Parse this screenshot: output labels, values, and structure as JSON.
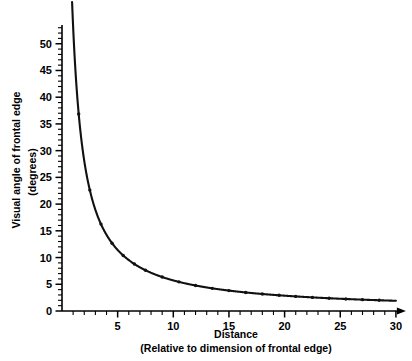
{
  "chart_data": {
    "type": "line",
    "title": "",
    "subtitle": "",
    "xlabel": "Distance",
    "xlabel_sub": "(Relative to dimension of frontal edge)",
    "ylabel": "Visual angle of frontal edge",
    "ylabel_sub": "(degrees)",
    "xlim": [
      0,
      30
    ],
    "ylim": [
      0,
      53.5
    ],
    "grid": false,
    "legend": null,
    "x_major_ticks": [
      5,
      10,
      15,
      20,
      25,
      30
    ],
    "x_major_tick_labels": [
      "5",
      "10",
      "15",
      "20",
      "25",
      "30"
    ],
    "x_minor_tick_step": 1,
    "y_major_ticks": [
      0,
      5,
      10,
      15,
      20,
      25,
      30,
      35,
      40,
      45,
      50
    ],
    "y_major_tick_labels": [
      "0",
      "5",
      "10",
      "15",
      "20",
      "25",
      "30",
      "35",
      "40",
      "45",
      "50"
    ],
    "y_minor_tick_step": 1,
    "series": [
      {
        "name": "Visual angle vs distance",
        "x": [
          1,
          1.2,
          1.5,
          2,
          2.5,
          3,
          3.5,
          4,
          5,
          6,
          7,
          8,
          9,
          10,
          11,
          12,
          13,
          14,
          15,
          16,
          17,
          18,
          19,
          20,
          21,
          22,
          23,
          24,
          25,
          26,
          27,
          28,
          29,
          30
        ],
        "y": [
          53.1,
          45.2,
          36.9,
          28.1,
          22.6,
          18.9,
          16.3,
          14.3,
          11.4,
          9.5,
          8.2,
          7.2,
          6.4,
          5.7,
          5.2,
          4.8,
          4.4,
          4.1,
          3.8,
          3.6,
          3.4,
          3.2,
          3.0,
          2.9,
          2.7,
          2.6,
          2.5,
          2.4,
          2.3,
          2.2,
          2.1,
          2.0,
          2.0,
          1.9
        ],
        "marker_x": [
          1.5,
          2.5,
          3.5,
          4.5,
          5.5,
          6.5,
          7.5,
          9,
          10.5,
          12,
          13.5,
          15,
          16.5,
          18,
          19.5,
          21,
          22.5,
          24,
          25.5,
          27,
          28.5
        ],
        "marker_y": [
          36.9,
          22.6,
          16.3,
          12.7,
          10.4,
          8.8,
          7.6,
          6.4,
          5.5,
          4.8,
          4.2,
          3.8,
          3.5,
          3.2,
          2.9,
          2.7,
          2.5,
          2.4,
          2.2,
          2.1,
          2.0
        ]
      }
    ]
  },
  "colors": {
    "background": "#ffffff",
    "axis": "#000000",
    "curve": "#111111",
    "text": "#000000"
  }
}
